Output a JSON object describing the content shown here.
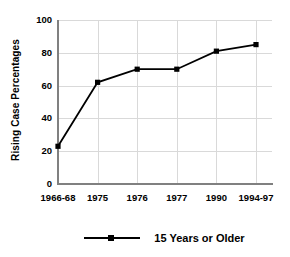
{
  "chart_data": {
    "type": "line",
    "title": "",
    "xlabel": "",
    "ylabel": "Rising Case Percentages",
    "categories": [
      "1966-68",
      "1975",
      "1976",
      "1977",
      "1990",
      "1994-97"
    ],
    "series": [
      {
        "name": "15 Years or Older",
        "values": [
          23,
          62,
          70,
          70,
          81,
          85
        ],
        "color": "#000000",
        "marker": "square"
      }
    ],
    "ylim": [
      0,
      100
    ],
    "y_ticks": [
      0,
      20,
      40,
      60,
      80,
      100
    ],
    "y_tick_labels": [
      "0",
      "20",
      "40",
      "60",
      "80",
      "100"
    ],
    "grid": true,
    "legend_position": "bottom"
  },
  "legend": {
    "entries": [
      {
        "label": "15 Years or Older"
      }
    ]
  },
  "axis": {
    "y_title": "Rising Case Percentages"
  }
}
